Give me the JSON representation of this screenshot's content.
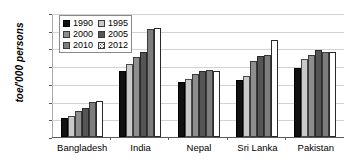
{
  "chart_data": {
    "type": "bar",
    "title": "",
    "xlabel": "",
    "ylabel": "toe/'000 persons",
    "ylim": [
      0,
      700
    ],
    "yticks": [
      0,
      100,
      200,
      300,
      400,
      500,
      600,
      700
    ],
    "grid": true,
    "legend_position": "top-left",
    "categories": [
      "Bangladesh",
      "India",
      "Nepal",
      "Sri Lanka",
      "Pakistan"
    ],
    "series": [
      {
        "name": "1990",
        "color": "#111111",
        "values": [
          105,
          370,
          310,
          320,
          390
        ]
      },
      {
        "name": "1995",
        "color": "#c9c9c9",
        "values": [
          120,
          410,
          330,
          345,
          440
        ]
      },
      {
        "name": "2000",
        "color": "#8e8e8e",
        "values": [
          145,
          450,
          355,
          430,
          465
        ]
      },
      {
        "name": "2005",
        "color": "#555555",
        "values": [
          165,
          480,
          375,
          455,
          490
        ]
      },
      {
        "name": "2010",
        "color": "#7d7d7d",
        "values": [
          195,
          610,
          380,
          465,
          480
        ]
      },
      {
        "name": "2012",
        "color": "#ffffff",
        "values": [
          205,
          615,
          375,
          545,
          480
        ]
      }
    ]
  },
  "legend": {
    "items": [
      {
        "label": "1990"
      },
      {
        "label": "1995"
      },
      {
        "label": "2000"
      },
      {
        "label": "2005"
      },
      {
        "label": "2010"
      },
      {
        "label": "2012"
      }
    ]
  }
}
